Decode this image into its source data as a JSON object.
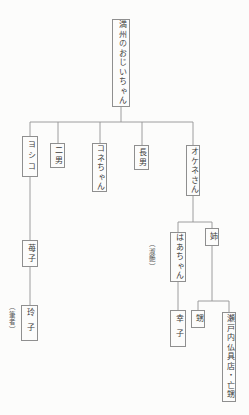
{
  "page": {
    "background": "#fcfcfb",
    "line_color": "#939393",
    "text_color": "#3d3d3d"
  },
  "tree": {
    "root": {
      "label": "満州のおじいちゃん"
    },
    "children": [
      {
        "label": "ヨシコ"
      },
      {
        "label": "二男"
      },
      {
        "label": "コネちゃん"
      },
      {
        "label": "長男"
      },
      {
        "label": "オケネさん"
      }
    ],
    "yoshiko_line": {
      "child": {
        "label": "苺子"
      },
      "grandchild": {
        "label": "玲子",
        "annotation": "（筆者）"
      }
    },
    "okene_line": {
      "children": [
        {
          "label": "はあちゃん",
          "annotation": "（淑艶）"
        },
        {
          "label": "姉"
        }
      ],
      "haachan_child": {
        "label": "幸子"
      },
      "ane_children": [
        {
          "label": "甥"
        },
        {
          "label": "瀬戸内仏具店・亡甥"
        }
      ]
    }
  }
}
